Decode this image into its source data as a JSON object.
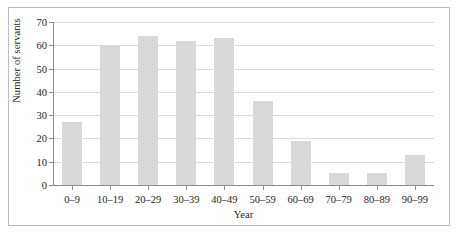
{
  "chart_data": {
    "type": "bar",
    "title": "",
    "xlabel": "Year",
    "ylabel": "Number of servants",
    "categories": [
      "0–9",
      "10–19",
      "20–29",
      "30–39",
      "40–49",
      "50–59",
      "60–69",
      "70–79",
      "80–89",
      "90–99"
    ],
    "values": [
      27,
      60,
      64,
      62,
      63,
      36,
      19,
      5,
      5,
      13
    ],
    "ylim": [
      0,
      70
    ],
    "yticks": [
      0,
      10,
      20,
      30,
      40,
      50,
      60,
      70
    ],
    "ytick_labels": [
      "0",
      "10",
      "20",
      "30",
      "40",
      "50",
      "60",
      "70"
    ],
    "grid": true,
    "legend": "none",
    "bar_color": "#d9d9d9",
    "gridline_color": "#dcdcdc",
    "axis_color": "#8c8c8c",
    "text_color": "#262626",
    "frame_color": "#bdbdbd",
    "background": "#ffffff"
  }
}
